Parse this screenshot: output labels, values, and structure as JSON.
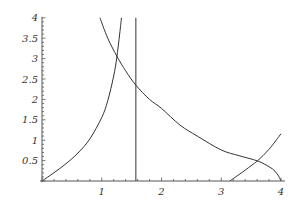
{
  "chart_data": {
    "type": "line",
    "title": "",
    "xlabel": "",
    "ylabel": "",
    "xlim": [
      0,
      4
    ],
    "ylim": [
      0,
      4
    ],
    "grid": false,
    "legend": null,
    "x_ticks": [
      {
        "value": 1,
        "label": "1"
      },
      {
        "value": 2,
        "label": "2"
      },
      {
        "value": 3,
        "label": "3"
      },
      {
        "value": 4,
        "label": "4"
      }
    ],
    "y_ticks": [
      {
        "value": 0.5,
        "label": "0.5"
      },
      {
        "value": 1,
        "label": "1"
      },
      {
        "value": 1.5,
        "label": "1.5"
      },
      {
        "value": 2,
        "label": "2"
      },
      {
        "value": 2.5,
        "label": "2.5"
      },
      {
        "value": 3,
        "label": "3"
      },
      {
        "value": 3.5,
        "label": "3.5"
      },
      {
        "value": 4,
        "label": "4"
      }
    ],
    "series": [
      {
        "name": "tan(x) branch 1",
        "x": [
          0,
          0.2,
          0.4,
          0.6,
          0.8,
          1.0,
          1.1,
          1.2,
          1.25,
          1.3,
          1.33
        ],
        "y": [
          0,
          0.203,
          0.423,
          0.684,
          1.03,
          1.557,
          1.965,
          2.572,
          3.01,
          3.602,
          4.0
        ]
      },
      {
        "name": "vertical asymptote x = π/2",
        "x": [
          1.5708,
          1.5708
        ],
        "y": [
          0,
          4
        ]
      },
      {
        "name": "decreasing curve",
        "x": [
          0.97,
          1.1,
          1.26,
          1.4,
          1.57,
          1.8,
          2.0,
          2.31,
          2.6,
          3.0,
          3.3,
          3.61,
          3.8,
          3.9,
          3.96,
          4.0
        ],
        "y": [
          4.0,
          3.5,
          3.04,
          2.7,
          2.35,
          2.0,
          1.78,
          1.37,
          1.1,
          0.76,
          0.62,
          0.49,
          0.35,
          0.24,
          0.12,
          0.0
        ]
      },
      {
        "name": "tan(x) branch 2",
        "x": [
          3.1416,
          3.3,
          3.5,
          3.61,
          3.8,
          4.0
        ],
        "y": [
          0,
          0.159,
          0.375,
          0.5,
          0.778,
          1.158
        ]
      }
    ]
  },
  "plot_frame": {
    "origin_px": [
      42,
      181
    ],
    "px_per_unit_x": 59.75,
    "px_per_unit_y": 40.8,
    "colors": {
      "curve": "#333333",
      "axis": "#555555",
      "background": "#ffffff"
    }
  }
}
